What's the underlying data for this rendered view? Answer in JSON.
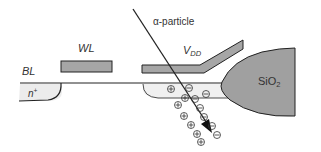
{
  "diagram": {
    "title": "",
    "labels": {
      "alpha_particle": "α-particle",
      "wordline": "WL",
      "vdd_main": "V",
      "vdd_sub": "DD",
      "bitline": "BL",
      "n_plus_main": "n",
      "n_plus_sup": "+",
      "oxide_main": "SiO",
      "oxide_sub": "2"
    },
    "charges": {
      "plus_symbol": "+",
      "minus_symbol": "−",
      "plus_count": 7,
      "minus_count": 7
    },
    "colors": {
      "gate_fill": "#a6a6a6",
      "oxide_fill": "#a0a0a0",
      "diffusion_fill": "#ececec",
      "line": "#222222",
      "text": "#333333"
    }
  }
}
